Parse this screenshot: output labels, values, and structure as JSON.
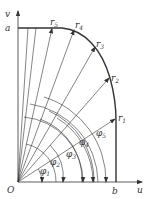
{
  "figure": {
    "axes": {
      "horizontal": "u",
      "vertical": "v",
      "origin": "O"
    },
    "points": {
      "a": "a",
      "b": "b"
    },
    "vectors": [
      {
        "name": "r",
        "sub": "1"
      },
      {
        "name": "r",
        "sub": "2"
      },
      {
        "name": "r",
        "sub": "3"
      },
      {
        "name": "r",
        "sub": "4"
      },
      {
        "name": "r",
        "sub": "5"
      }
    ],
    "angles": [
      {
        "name": "φ",
        "sub": "1"
      },
      {
        "name": "φ",
        "sub": "2"
      },
      {
        "name": "φ",
        "sub": "3"
      },
      {
        "name": "φ",
        "sub": "4"
      },
      {
        "name": "φ",
        "sub": "5"
      }
    ],
    "line_color": "#333333"
  }
}
